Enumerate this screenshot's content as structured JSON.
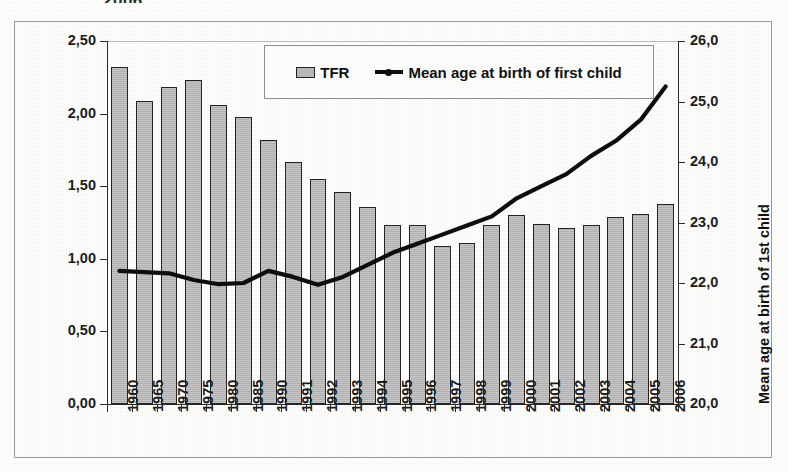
{
  "cut_title": "2006",
  "axes": {
    "left_title": "Total fertility rate (TFR)",
    "right_title": "Mean age at birth of 1st child",
    "left_ticks": [
      "0,00",
      "0,50",
      "1,00",
      "1,50",
      "2,00",
      "2,50"
    ],
    "right_ticks": [
      "20,0",
      "21,0",
      "22,0",
      "23,0",
      "24,0",
      "25,0",
      "26,0"
    ]
  },
  "legend": {
    "bar_label": "TFR",
    "line_label": "Mean age at birth of first child"
  },
  "chart_data": {
    "type": "bar",
    "title": "",
    "xlabel": "",
    "ylabel": "Total fertility rate (TFR)",
    "y2label": "Mean age at birth of 1st child",
    "ylim": [
      0.0,
      2.5
    ],
    "y2lim": [
      20.0,
      26.0
    ],
    "grid": false,
    "legend_position": "top-center",
    "categories": [
      "1960",
      "1965",
      "1970",
      "1975",
      "1980",
      "1985",
      "1990",
      "1991",
      "1992",
      "1993",
      "1994",
      "1995",
      "1996",
      "1997",
      "1998",
      "1999",
      "2000",
      "2001",
      "2002",
      "2003",
      "2004",
      "2005",
      "2006"
    ],
    "series": [
      {
        "name": "TFR",
        "type": "bar",
        "axis": "left",
        "values": [
          2.32,
          2.09,
          2.18,
          2.23,
          2.06,
          1.98,
          1.82,
          1.67,
          1.55,
          1.46,
          1.36,
          1.23,
          1.23,
          1.09,
          1.11,
          1.23,
          1.3,
          1.24,
          1.21,
          1.23,
          1.29,
          1.31,
          1.38
        ]
      },
      {
        "name": "Mean age at birth of first child",
        "type": "line",
        "axis": "right",
        "values": [
          22.2,
          22.18,
          22.16,
          22.05,
          21.98,
          22.0,
          22.2,
          22.1,
          21.97,
          22.1,
          22.3,
          22.5,
          22.65,
          22.8,
          22.95,
          23.1,
          23.4,
          23.6,
          23.8,
          24.1,
          24.35,
          24.7,
          25.25
        ]
      }
    ]
  }
}
